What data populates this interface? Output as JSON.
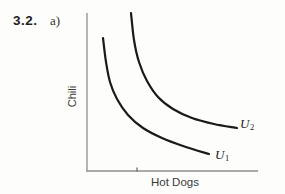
{
  "page": {
    "background": "#fdfdfc"
  },
  "heading": {
    "problem_number": "3.2.",
    "part_label": "a)"
  },
  "figure": {
    "ylabel": "Chili",
    "xlabel": "Hot Dogs",
    "curve_label_u2": {
      "letter": "U",
      "subscript": "2"
    },
    "curve_label_u1": {
      "letter": "U",
      "subscript": "1"
    }
  },
  "colors": {
    "curve": "#1a1a1a",
    "axis": "#8e8e8e",
    "tick": "#6f6f6f",
    "text": "#3a3a3a"
  },
  "chart_data": {
    "type": "line",
    "title": "",
    "xlabel": "Hot Dogs",
    "ylabel": "Chili",
    "axis_tick_labels": "none (qualitative axes, one unlabeled tick on x-axis)",
    "legend": "labels at right end of each curve: U1 (lower), U2 (upper)",
    "coordinate_space": "screenshot pixels, y increases downward",
    "axes_px": {
      "origin": [
        87,
        171
      ],
      "y_top": 13,
      "x_right": 258,
      "x_tick_at": 137
    },
    "series": [
      {
        "name": "U1",
        "label": "U1",
        "points_px": [
          [
            103,
            38
          ],
          [
            106,
            62
          ],
          [
            110,
            82
          ],
          [
            117,
            99
          ],
          [
            128,
            115
          ],
          [
            143,
            128
          ],
          [
            162,
            138
          ],
          [
            183,
            146
          ],
          [
            209,
            154
          ]
        ]
      },
      {
        "name": "U2",
        "label": "U2",
        "points_px": [
          [
            131,
            13
          ],
          [
            134,
            40
          ],
          [
            139,
            62
          ],
          [
            147,
            81
          ],
          [
            158,
            97
          ],
          [
            173,
            109
          ],
          [
            192,
            118
          ],
          [
            214,
            124
          ],
          [
            237,
            128
          ]
        ]
      }
    ]
  }
}
